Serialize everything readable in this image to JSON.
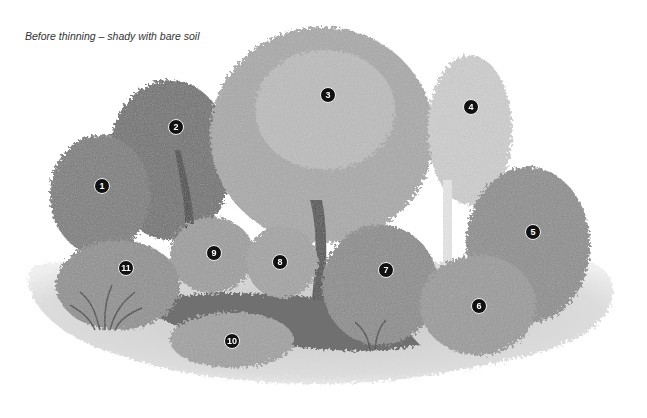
{
  "caption": "Before thinning – shady with bare soil",
  "markers": [
    {
      "label": "1",
      "name": "shrub-1",
      "x": 101,
      "y": 185
    },
    {
      "label": "2",
      "name": "tree-2",
      "x": 175,
      "y": 126
    },
    {
      "label": "3",
      "name": "tree-3",
      "x": 327,
      "y": 94
    },
    {
      "label": "4",
      "name": "birch-tree-4",
      "x": 470,
      "y": 106
    },
    {
      "label": "5",
      "name": "shrub-5",
      "x": 532,
      "y": 231
    },
    {
      "label": "6",
      "name": "shrub-6",
      "x": 478,
      "y": 305
    },
    {
      "label": "7",
      "name": "shrub-7",
      "x": 385,
      "y": 269
    },
    {
      "label": "8",
      "name": "shrub-8",
      "x": 279,
      "y": 261
    },
    {
      "label": "9",
      "name": "shrub-9",
      "x": 213,
      "y": 252
    },
    {
      "label": "10",
      "name": "groundcover-10",
      "x": 231,
      "y": 340
    },
    {
      "label": "11",
      "name": "shrub-11",
      "x": 125,
      "y": 267
    }
  ]
}
